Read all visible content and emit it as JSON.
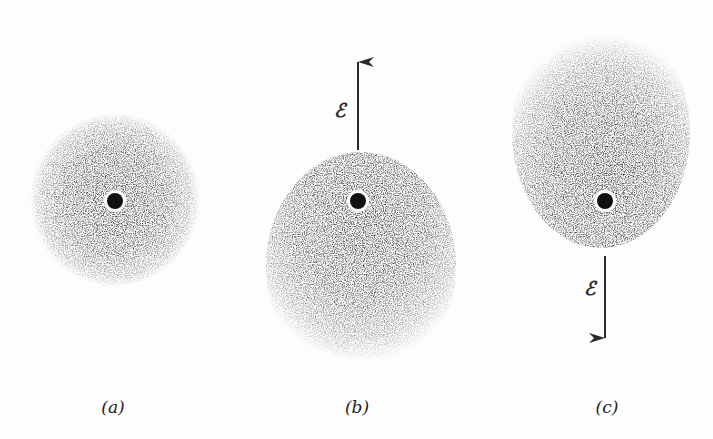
{
  "figure": {
    "background": "#fdfdfd",
    "cloud_color": "#1a1a1a",
    "panels": [
      {
        "label": "(a)",
        "label_x": 113,
        "cloud": {
          "cx": 115,
          "cy": 200,
          "rx": 85,
          "ry": 87
        },
        "nucleus": {
          "cx": 115,
          "cy": 201
        },
        "field": null
      },
      {
        "label": "(b)",
        "label_x": 357,
        "cloud": {
          "cx": 361,
          "cy": 266,
          "rx": 95,
          "ry": 114
        },
        "nucleus": {
          "cx": 358,
          "cy": 201
        },
        "field": {
          "symbol": "ℰ",
          "direction": "up",
          "x": 358,
          "y1": 150,
          "y2": 62,
          "label_x": 340,
          "label_y": 110
        }
      },
      {
        "label": "(c)",
        "label_x": 607,
        "cloud": {
          "cx": 601,
          "cy": 132,
          "rx": 89,
          "ry": 116
        },
        "nucleus": {
          "cx": 605,
          "cy": 201
        },
        "field": {
          "symbol": "ℰ",
          "direction": "down",
          "x": 605,
          "y1": 256,
          "y2": 338,
          "label_x": 590,
          "label_y": 288
        }
      }
    ]
  }
}
